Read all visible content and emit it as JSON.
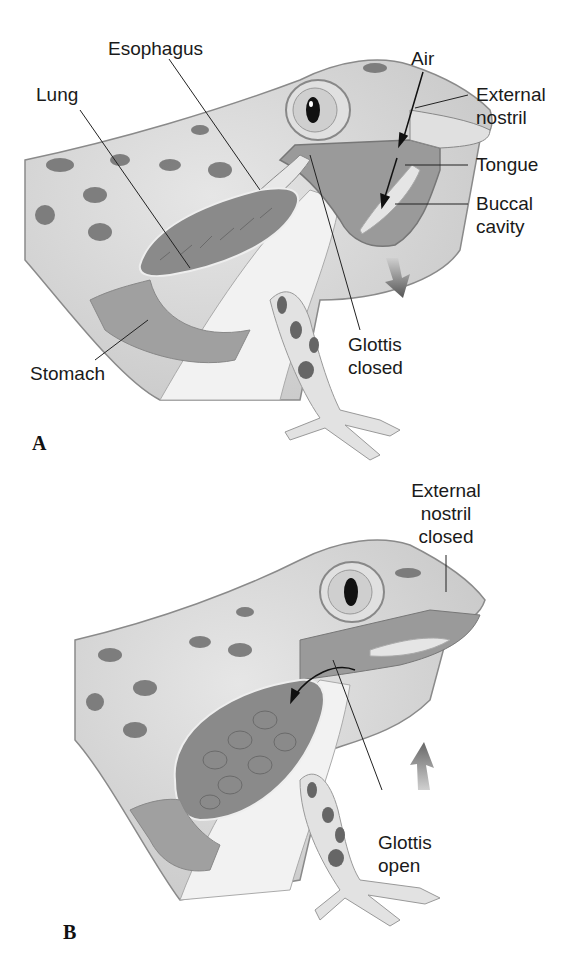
{
  "panels": [
    {
      "id": "A",
      "letter": "A",
      "labels": {
        "esophagus": "Esophagus",
        "lung": "Lung",
        "air": "Air",
        "external_nostril_1": "External",
        "external_nostril_2": "nostril",
        "tongue": "Tongue",
        "buccal_1": "Buccal",
        "buccal_2": "cavity",
        "stomach": "Stomach",
        "glottis_1": "Glottis",
        "glottis_2": "closed"
      },
      "movement_arrow": "down"
    },
    {
      "id": "B",
      "letter": "B",
      "labels": {
        "nostril_1": "External",
        "nostril_2": "nostril",
        "nostril_3": "closed",
        "glottis_1": "Glottis",
        "glottis_2": "open"
      },
      "movement_arrow": "up"
    }
  ],
  "colors": {
    "skin": "#d9d9d9",
    "skin_dark": "#b5b5b5",
    "spots": "#6e6e6e",
    "cavity": "#9a9a9a",
    "lung": "#8a8a8a",
    "outline": "#7a7a7a",
    "text": "#1a1a1a"
  }
}
